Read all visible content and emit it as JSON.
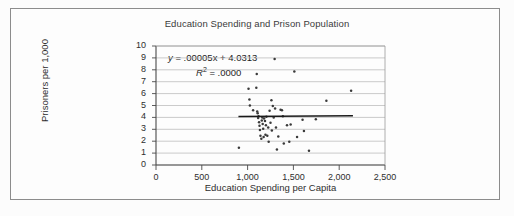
{
  "chart_data": {
    "type": "scatter",
    "title": "Education Spending and Prison Population",
    "xlabel": "Education Spending per Capita",
    "ylabel": "Prisoners per 1,000",
    "xlim": [
      0,
      2500
    ],
    "ylim": [
      0,
      10
    ],
    "xticks": [
      0,
      500,
      1000,
      1500,
      2000,
      2500
    ],
    "xtick_labels": [
      "0",
      "500",
      "1,000",
      "1,500",
      "2,000",
      "2,500"
    ],
    "yticks": [
      0,
      1,
      2,
      3,
      4,
      5,
      6,
      7,
      8,
      9,
      10
    ],
    "ytick_labels": [
      "0",
      "1",
      "2",
      "3",
      "4",
      "5",
      "6",
      "7",
      "8",
      "9",
      "10"
    ],
    "grid": "horizontal",
    "legend": "none",
    "annotations": {
      "equation_prefix": "y",
      "equation_body": " = .00005x + 4.0313",
      "equation_full": "y = .00005x + 4.0313",
      "r2_symbol": "R",
      "r2_exponent": "2",
      "r2_value": " = .0000",
      "r2_full": "R2 = .0000"
    },
    "trendline": {
      "slope": 5e-05,
      "intercept": 4.0313,
      "x_start": 900,
      "x_end": 2150,
      "y_start": 4.08,
      "y_end": 4.14,
      "color": "#1a1a1a"
    },
    "point_color": "#3a3a3a",
    "points": [
      {
        "x": 905,
        "y": 1.45
      },
      {
        "x": 1010,
        "y": 6.4
      },
      {
        "x": 1020,
        "y": 5.5
      },
      {
        "x": 1025,
        "y": 5.0
      },
      {
        "x": 1060,
        "y": 4.6
      },
      {
        "x": 1095,
        "y": 6.5
      },
      {
        "x": 1100,
        "y": 7.65
      },
      {
        "x": 1105,
        "y": 4.5
      },
      {
        "x": 1110,
        "y": 4.35
      },
      {
        "x": 1115,
        "y": 3.95
      },
      {
        "x": 1120,
        "y": 4.1
      },
      {
        "x": 1125,
        "y": 3.6
      },
      {
        "x": 1130,
        "y": 3.3
      },
      {
        "x": 1135,
        "y": 2.95
      },
      {
        "x": 1140,
        "y": 2.45
      },
      {
        "x": 1150,
        "y": 2.2
      },
      {
        "x": 1155,
        "y": 3.75
      },
      {
        "x": 1160,
        "y": 4.0
      },
      {
        "x": 1165,
        "y": 3.45
      },
      {
        "x": 1170,
        "y": 3.05
      },
      {
        "x": 1175,
        "y": 2.35
      },
      {
        "x": 1180,
        "y": 3.9
      },
      {
        "x": 1190,
        "y": 3.7
      },
      {
        "x": 1195,
        "y": 2.55
      },
      {
        "x": 1200,
        "y": 3.35
      },
      {
        "x": 1205,
        "y": 4.05
      },
      {
        "x": 1215,
        "y": 2.45
      },
      {
        "x": 1225,
        "y": 3.15
      },
      {
        "x": 1230,
        "y": 1.95
      },
      {
        "x": 1240,
        "y": 4.55
      },
      {
        "x": 1250,
        "y": 3.55
      },
      {
        "x": 1260,
        "y": 5.45
      },
      {
        "x": 1265,
        "y": 2.9
      },
      {
        "x": 1275,
        "y": 4.95
      },
      {
        "x": 1285,
        "y": 4.0
      },
      {
        "x": 1295,
        "y": 8.9
      },
      {
        "x": 1300,
        "y": 4.75
      },
      {
        "x": 1310,
        "y": 3.15
      },
      {
        "x": 1320,
        "y": 1.3
      },
      {
        "x": 1335,
        "y": 2.4
      },
      {
        "x": 1360,
        "y": 4.65
      },
      {
        "x": 1375,
        "y": 4.6
      },
      {
        "x": 1385,
        "y": 4.1
      },
      {
        "x": 1395,
        "y": 1.8
      },
      {
        "x": 1430,
        "y": 3.35
      },
      {
        "x": 1455,
        "y": 1.95
      },
      {
        "x": 1470,
        "y": 3.4
      },
      {
        "x": 1510,
        "y": 7.85
      },
      {
        "x": 1540,
        "y": 2.35
      },
      {
        "x": 1600,
        "y": 3.8
      },
      {
        "x": 1615,
        "y": 2.85
      },
      {
        "x": 1670,
        "y": 1.2
      },
      {
        "x": 1745,
        "y": 3.85
      },
      {
        "x": 1860,
        "y": 5.4
      },
      {
        "x": 2130,
        "y": 6.25
      }
    ]
  }
}
